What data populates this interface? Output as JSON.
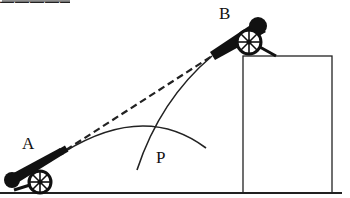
{
  "diagram": {
    "type": "projectile-collision-diagram",
    "labels": {
      "cannon_a": "A",
      "cannon_b": "B",
      "intersection": "P"
    },
    "elements": {
      "ground": "ground line",
      "building": "tall rectangular building on right",
      "cannon_a": "cannon on ground at left, aimed up-right",
      "cannon_b": "cannon on building roof, aimed down-left",
      "line_of_sight": "dashed straight line joining muzzles of A and B",
      "trajectory_a": "parabolic arc fired from A",
      "trajectory_b": "curved path fired from B",
      "intersection_point": "trajectories cross near P"
    },
    "colors": {
      "ink": "#111111",
      "background": "#ffffff"
    }
  }
}
